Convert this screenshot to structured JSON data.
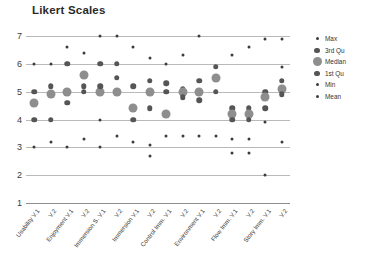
{
  "chart_data": {
    "type": "scatter",
    "title": "Likert Scales",
    "xlabel": "",
    "ylabel": "",
    "ylim": [
      1,
      7
    ],
    "yticks": [
      7,
      6,
      5,
      4,
      3,
      2,
      1
    ],
    "grid": true,
    "legend_position": "right",
    "legend": [
      {
        "name": "Max",
        "marker": "small-dot",
        "color": "#3c3c3c",
        "size": 3
      },
      {
        "name": "3rd Qu",
        "marker": "medium-dot",
        "color": "#555555",
        "size": 5.5
      },
      {
        "name": "Median",
        "marker": "large-dot",
        "color": "#8e8e8e",
        "size": 9
      },
      {
        "name": "1st Qu",
        "marker": "medium-dot",
        "color": "#555555",
        "size": 5.5
      },
      {
        "name": "Min",
        "marker": "small-dot",
        "color": "#3c3c3c",
        "size": 3
      },
      {
        "name": "Mean",
        "marker": "small-dot",
        "color": "#3c3c3c",
        "size": 3
      }
    ],
    "categories": [
      "Usability V.1",
      "V.2",
      "Enjoyment V.1",
      "V.2",
      "Immersion S. V.1",
      "V.2",
      "Immersion V.1",
      "V.2",
      "Control Imm. V.1",
      "V.2",
      "Environment V.1",
      "V.2",
      "Flow Imm. V.1",
      "V.2",
      "Story Imm. V.1",
      "V.2"
    ],
    "series": [
      {
        "name": "Max",
        "values": [
          6,
          6,
          6.6,
          6.4,
          7,
          7,
          6.6,
          6.2,
          6,
          6.3,
          7,
          5.9,
          6.3,
          6.6,
          6.9,
          6.9
        ]
      },
      {
        "name": "3rd Qu",
        "values": [
          5,
          5.2,
          5,
          6,
          6,
          6,
          5.2,
          5.4,
          5.3,
          5.1,
          5.4,
          5.9,
          4.4,
          4.4,
          5,
          5.4
        ]
      },
      {
        "name": "Median",
        "values": [
          4.6,
          4.9,
          5,
          5.6,
          5,
          5,
          4.5,
          5,
          4.2,
          4.7,
          5,
          5.5,
          4.2,
          4.2,
          4.8,
          5.1
        ]
      },
      {
        "name": "1st Qu",
        "values": [
          4,
          4,
          4.6,
          5,
          4.6,
          5,
          4,
          4.5,
          4,
          4,
          4.7,
          5,
          4,
          4,
          4.4,
          4.9
        ]
      },
      {
        "name": "Min",
        "values": [
          3,
          3.2,
          3,
          3.3,
          3,
          3,
          3.2,
          3.1,
          3,
          3.4,
          3.4,
          3.4,
          3.3,
          3.3,
          2,
          3.2
        ]
      },
      {
        "name": "Mean",
        "values": [
          4.1,
          4.3,
          4.8,
          5.2,
          5.1,
          5.1,
          4.3,
          4.7,
          4.1,
          4.3,
          4.9,
          5.3,
          4.1,
          4.2,
          4.6,
          5.1
        ]
      }
    ],
    "points": [
      {
        "col": 0,
        "series": "Max",
        "v": 6.0
      },
      {
        "col": 0,
        "series": "3rd Qu",
        "v": 5.0
      },
      {
        "col": 0,
        "series": "Median",
        "v": 4.6
      },
      {
        "col": 0,
        "series": "1st Qu",
        "v": 4.0
      },
      {
        "col": 0,
        "series": "Min",
        "v": 3.0
      },
      {
        "col": 1,
        "series": "Max",
        "v": 6.0
      },
      {
        "col": 1,
        "series": "3rd Qu",
        "v": 5.2
      },
      {
        "col": 1,
        "series": "Median",
        "v": 4.9
      },
      {
        "col": 1,
        "series": "1st Qu",
        "v": 4.0
      },
      {
        "col": 1,
        "series": "Min",
        "v": 3.2
      },
      {
        "col": 2,
        "series": "Max",
        "v": 6.6
      },
      {
        "col": 2,
        "series": "3rd Qu",
        "v": 6.0
      },
      {
        "col": 2,
        "series": "Median",
        "v": 5.0
      },
      {
        "col": 2,
        "series": "1st Qu",
        "v": 4.6
      },
      {
        "col": 2,
        "series": "Min",
        "v": 3.0
      },
      {
        "col": 3,
        "series": "Max",
        "v": 6.4
      },
      {
        "col": 3,
        "series": "3rd Qu",
        "v": 5.2
      },
      {
        "col": 3,
        "series": "Median",
        "v": 5.6
      },
      {
        "col": 3,
        "series": "1st Qu",
        "v": 5.0
      },
      {
        "col": 3,
        "series": "Min",
        "v": 3.3
      },
      {
        "col": 4,
        "series": "Max",
        "v": 7.0
      },
      {
        "col": 4,
        "series": "3rd Qu",
        "v": 6.0
      },
      {
        "col": 4,
        "series": "Median",
        "v": 5.0
      },
      {
        "col": 4,
        "series": "1st Qu",
        "v": 5.2
      },
      {
        "col": 4,
        "series": "Min",
        "v": 4.0
      },
      {
        "col": 4,
        "series": "Mean",
        "v": 3.0
      },
      {
        "col": 5,
        "series": "Max",
        "v": 7.0
      },
      {
        "col": 5,
        "series": "3rd Qu",
        "v": 6.0
      },
      {
        "col": 5,
        "series": "Median",
        "v": 5.0
      },
      {
        "col": 5,
        "series": "1st Qu",
        "v": 5.5
      },
      {
        "col": 5,
        "series": "Min",
        "v": 3.4
      },
      {
        "col": 6,
        "series": "Max",
        "v": 6.6
      },
      {
        "col": 6,
        "series": "3rd Qu",
        "v": 5.2
      },
      {
        "col": 6,
        "series": "Median",
        "v": 4.4
      },
      {
        "col": 6,
        "series": "1st Qu",
        "v": 4.0
      },
      {
        "col": 6,
        "series": "Min",
        "v": 3.2
      },
      {
        "col": 7,
        "series": "Max",
        "v": 6.2
      },
      {
        "col": 7,
        "series": "3rd Qu",
        "v": 5.4
      },
      {
        "col": 7,
        "series": "Median",
        "v": 5.0
      },
      {
        "col": 7,
        "series": "1st Qu",
        "v": 4.4
      },
      {
        "col": 7,
        "series": "Min",
        "v": 3.1
      },
      {
        "col": 7,
        "series": "Mean",
        "v": 2.7
      },
      {
        "col": 8,
        "series": "Max",
        "v": 6.0
      },
      {
        "col": 8,
        "series": "3rd Qu",
        "v": 5.3
      },
      {
        "col": 8,
        "series": "Median",
        "v": 4.2
      },
      {
        "col": 8,
        "series": "1st Qu",
        "v": 5.0
      },
      {
        "col": 8,
        "series": "Min",
        "v": 3.4
      },
      {
        "col": 9,
        "series": "Max",
        "v": 6.3
      },
      {
        "col": 9,
        "series": "3rd Qu",
        "v": 5.1
      },
      {
        "col": 9,
        "series": "Median",
        "v": 5.0
      },
      {
        "col": 9,
        "series": "1st Qu",
        "v": 4.8
      },
      {
        "col": 9,
        "series": "Min",
        "v": 3.4
      },
      {
        "col": 10,
        "series": "Max",
        "v": 7.0
      },
      {
        "col": 10,
        "series": "3rd Qu",
        "v": 5.4
      },
      {
        "col": 10,
        "series": "Median",
        "v": 5.0
      },
      {
        "col": 10,
        "series": "1st Qu",
        "v": 4.7
      },
      {
        "col": 10,
        "series": "Min",
        "v": 3.4
      },
      {
        "col": 11,
        "series": "Max",
        "v": 5.9
      },
      {
        "col": 11,
        "series": "3rd Qu",
        "v": 5.9
      },
      {
        "col": 11,
        "series": "Median",
        "v": 5.5
      },
      {
        "col": 11,
        "series": "1st Qu",
        "v": 5.0
      },
      {
        "col": 11,
        "series": "Min",
        "v": 3.4
      },
      {
        "col": 12,
        "series": "Max",
        "v": 6.3
      },
      {
        "col": 12,
        "series": "3rd Qu",
        "v": 4.4
      },
      {
        "col": 12,
        "series": "Median",
        "v": 4.2
      },
      {
        "col": 12,
        "series": "1st Qu",
        "v": 4.0
      },
      {
        "col": 12,
        "series": "Min",
        "v": 3.3
      },
      {
        "col": 12,
        "series": "Mean",
        "v": 2.8
      },
      {
        "col": 13,
        "series": "Max",
        "v": 6.6
      },
      {
        "col": 13,
        "series": "3rd Qu",
        "v": 4.4
      },
      {
        "col": 13,
        "series": "Median",
        "v": 4.2
      },
      {
        "col": 13,
        "series": "1st Qu",
        "v": 4.0
      },
      {
        "col": 13,
        "series": "Min",
        "v": 3.3
      },
      {
        "col": 13,
        "series": "Mean",
        "v": 2.8
      },
      {
        "col": 14,
        "series": "Max",
        "v": 6.9
      },
      {
        "col": 14,
        "series": "3rd Qu",
        "v": 5.0
      },
      {
        "col": 14,
        "series": "Median",
        "v": 4.8
      },
      {
        "col": 14,
        "series": "1st Qu",
        "v": 4.4
      },
      {
        "col": 14,
        "series": "Min",
        "v": 3.9
      },
      {
        "col": 14,
        "series": "Mean",
        "v": 2.0
      },
      {
        "col": 15,
        "series": "Max",
        "v": 6.9
      },
      {
        "col": 15,
        "series": "3rd Qu",
        "v": 5.4
      },
      {
        "col": 15,
        "series": "Median",
        "v": 5.1
      },
      {
        "col": 15,
        "series": "1st Qu",
        "v": 4.9
      },
      {
        "col": 15,
        "series": "Min",
        "v": 5.9
      },
      {
        "col": 15,
        "series": "Mean",
        "v": 3.2
      }
    ]
  }
}
